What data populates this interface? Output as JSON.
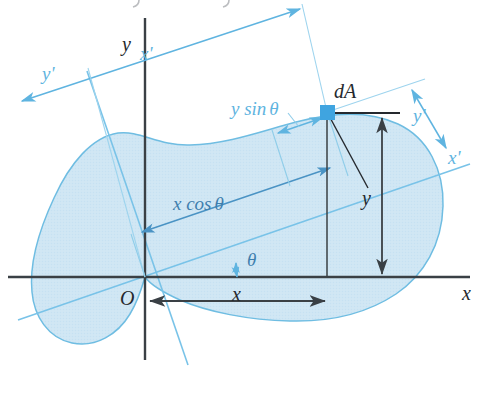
{
  "figure": {
    "colors": {
      "region_fill": "#cfe6f4",
      "region_outline": "#6fbde2",
      "primed_axis": "#79c3e8",
      "dimension_blue": "#5fb4e0",
      "dimension_blue_deep": "#3f7fae",
      "axis_dark": "#3a4045",
      "element_marker": "#3fa4e0",
      "text_dark": "#25292e"
    },
    "labels": {
      "y_axis": "y",
      "x_axis": "x",
      "origin": "O",
      "x_prime_axis": "x'",
      "y_prime_axis": "y'",
      "x_prime_dim": "x'",
      "y_prime_dim": "y'",
      "element": "dA",
      "x_dim": "x",
      "y_dim": "y",
      "x_cos_theta": "x cos",
      "y_sin_theta": "y sin",
      "theta": "θ",
      "theta_symbol": "θ"
    },
    "geometry": {
      "origin": {
        "x": 145,
        "y": 277
      },
      "element_point": {
        "x": 327,
        "y": 112
      },
      "rotation_angle_deg": 19,
      "x_value_px": 182,
      "y_value_px": 165
    },
    "icons": {
      "element_marker": "filled-square-marker",
      "angle_arc": "theta-arc-arrow"
    }
  }
}
